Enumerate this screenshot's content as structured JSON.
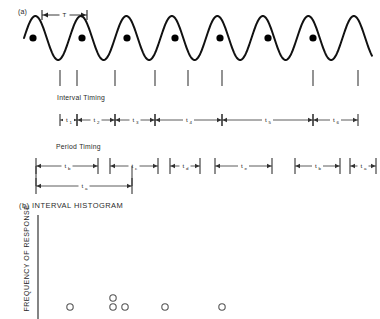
{
  "figure": {
    "panel_a": {
      "label": "(a)",
      "period_marker_label": "T",
      "wave": {
        "type": "sine",
        "cycles": 7.5,
        "baseline_y": 38,
        "amplitude": 22,
        "period_px": 45.5,
        "x_start": 24,
        "x_end": 372,
        "stroke_color": "#111111",
        "stroke_width": 2.0
      },
      "response_dots": {
        "count": 7,
        "x": [
          33,
          82,
          127,
          175,
          220,
          268,
          313
        ],
        "y": 38,
        "radius": 3.6,
        "fill": "#000000"
      },
      "event_ticks": {
        "count": 8,
        "x": [
          60,
          77,
          115,
          155,
          222,
          313,
          358,
          188
        ],
        "y_top": 70,
        "y_bottom": 86,
        "color": "#4a4a4a"
      },
      "interval_timing": {
        "label": "Interval Timing",
        "axis_y": 120,
        "boundaries": [
          60,
          77,
          115,
          155,
          222,
          313,
          358
        ],
        "spans": [
          {
            "label": "t",
            "sub": "1",
            "x1": 60,
            "x2": 77
          },
          {
            "label": "t",
            "sub": "2",
            "x1": 77,
            "x2": 115
          },
          {
            "label": "t",
            "sub": "3",
            "x1": 115,
            "x2": 155
          },
          {
            "label": "t",
            "sub": "4",
            "x1": 155,
            "x2": 222
          },
          {
            "label": "t",
            "sub": "5",
            "x1": 222,
            "x2": 313
          },
          {
            "label": "t",
            "sub": "6",
            "x1": 313,
            "x2": 358
          }
        ]
      },
      "period_timing": {
        "label": "Period Timing",
        "axis_y": 166,
        "spans": [
          {
            "label": "t",
            "sub": "b",
            "x1": 36,
            "x2": 98
          },
          {
            "label": "t",
            "sub": "c",
            "x1": 110,
            "x2": 158
          },
          {
            "label": "t",
            "sub": "d",
            "x1": 170,
            "x2": 200
          },
          {
            "label": "t",
            "sub": "e",
            "x1": 215,
            "x2": 272
          },
          {
            "label": "t",
            "sub": "b",
            "x1": 295,
            "x2": 340
          },
          {
            "label": "t",
            "sub": "a",
            "x1": 350,
            "x2": 376
          }
        ],
        "lower_span": {
          "label": "t",
          "sub": "a",
          "x1": 36,
          "x2": 132,
          "axis_y": 186
        }
      }
    },
    "panel_b": {
      "label": "(b) INTERVAL HISTOGRAM",
      "y_axis_title": "FREQUENCY OF RESPONSE",
      "axis": {
        "x": 38,
        "y_top": 215,
        "y_bottom": 319,
        "color": "#333333"
      },
      "points": [
        {
          "x": 70,
          "y": 307
        },
        {
          "x": 113,
          "y": 298
        },
        {
          "x": 113,
          "y": 307
        },
        {
          "x": 125,
          "y": 307
        },
        {
          "x": 165,
          "y": 307
        },
        {
          "x": 222,
          "y": 307
        }
      ],
      "point_style": {
        "radius": 3.2,
        "stroke_color": "#555555",
        "fill": "none"
      }
    }
  }
}
